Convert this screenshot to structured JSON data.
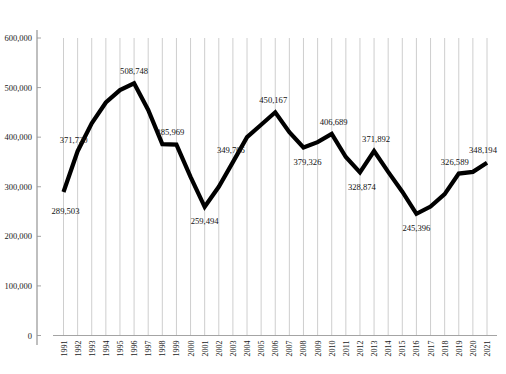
{
  "chart_data": {
    "type": "line",
    "title": "",
    "subtitle": "",
    "xlabel": "",
    "ylabel": "",
    "grid": "vertical",
    "legend": "none",
    "ylim": [
      0,
      600000
    ],
    "yticks": [
      0,
      100000,
      200000,
      300000,
      400000,
      500000,
      600000
    ],
    "ytick_labels": [
      "0",
      "100,000",
      "200,000",
      "300,000",
      "400,000",
      "500,000",
      "600,000"
    ],
    "categories": [
      "1991",
      "1992",
      "1993",
      "1994",
      "1995",
      "1996",
      "1997",
      "1998",
      "1999",
      "2000",
      "2001",
      "2002",
      "2003",
      "2004",
      "2005",
      "2006",
      "2007",
      "2008",
      "2009",
      "2010",
      "2011",
      "2012",
      "2013",
      "2014",
      "2015",
      "2016",
      "2017",
      "2018",
      "2019",
      "2020",
      "2021"
    ],
    "values": [
      289503,
      371720,
      428000,
      470000,
      495000,
      508748,
      455000,
      385969,
      385000,
      320000,
      259494,
      300000,
      349706,
      400000,
      425000,
      450167,
      410000,
      379326,
      390000,
      406689,
      360000,
      328874,
      371892,
      330000,
      290000,
      245396,
      260000,
      285000,
      326589,
      330000,
      348194
    ],
    "series": [
      {
        "name": "series-1",
        "color": "#000000",
        "values": [
          289503,
          371720,
          428000,
          470000,
          495000,
          508748,
          455000,
          385969,
          385000,
          320000,
          259494,
          300000,
          349706,
          400000,
          425000,
          450167,
          410000,
          379326,
          390000,
          406689,
          360000,
          328874,
          371892,
          330000,
          290000,
          245396,
          260000,
          285000,
          326589,
          330000,
          348194
        ]
      }
    ],
    "annotations": [
      {
        "category": "1991",
        "value": 289503,
        "text": "289,503",
        "dx": 2,
        "dy": 22
      },
      {
        "category": "1992",
        "value": 371720,
        "text": "371,720",
        "dx": -4,
        "dy": -8
      },
      {
        "category": "1996",
        "value": 508748,
        "text": "508,748",
        "dx": 0,
        "dy": -9
      },
      {
        "category": "1998",
        "value": 385969,
        "text": "385,969",
        "dx": 8,
        "dy": -9
      },
      {
        "category": "2001",
        "value": 259494,
        "text": "259,494",
        "dx": 0,
        "dy": 17
      },
      {
        "category": "2003",
        "value": 349706,
        "text": "349,706",
        "dx": -2,
        "dy": -9
      },
      {
        "category": "2006",
        "value": 450167,
        "text": "450,167",
        "dx": -2,
        "dy": -9
      },
      {
        "category": "2008",
        "value": 379326,
        "text": "379,326",
        "dx": 4,
        "dy": 18
      },
      {
        "category": "2010",
        "value": 406689,
        "text": "406,689",
        "dx": 2,
        "dy": -9
      },
      {
        "category": "2012",
        "value": 328874,
        "text": "328,874",
        "dx": 2,
        "dy": 18
      },
      {
        "category": "2013",
        "value": 371892,
        "text": "371,892",
        "dx": 2,
        "dy": -9
      },
      {
        "category": "2016",
        "value": 245396,
        "text": "245,396",
        "dx": 0,
        "dy": 17
      },
      {
        "category": "2019",
        "value": 326589,
        "text": "326,589",
        "dx": -4,
        "dy": -9
      },
      {
        "category": "2021",
        "value": 348194,
        "text": "348,194",
        "dx": -4,
        "dy": -10
      }
    ],
    "colors": {
      "line": "#000000",
      "gridline": "#c8c8c8",
      "axis": "#8a8a8a",
      "text": "#1a1a1a",
      "background": "#ffffff"
    }
  }
}
